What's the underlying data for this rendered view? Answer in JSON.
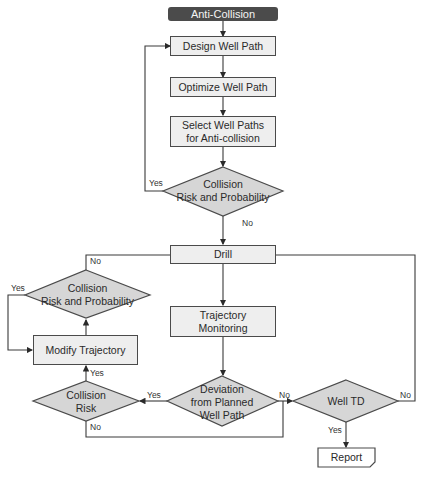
{
  "title": "Anti-Collision",
  "colors": {
    "start_fill": "#4b4b4b",
    "box_fill": "#eeeeee",
    "diamond_fill": "#d6d6d6",
    "line": "#3a3a3a"
  },
  "nodes": {
    "start": "Anti-Collision",
    "design": "Design Well Path",
    "optimize": "Optimize Well Path",
    "select_l1": "Select Well Paths",
    "select_l2": "for Anti-collision",
    "risk1_l1": "Collision",
    "risk1_l2": "Risk and Probability",
    "drill": "Drill",
    "risk2_l1": "Collision",
    "risk2_l2": "Risk and Probability",
    "modify": "Modify Trajectory",
    "monitor_l1": "Trajectory",
    "monitor_l2": "Monitoring",
    "risk3_l1": "Collision",
    "risk3_l2": "Risk",
    "deviation_l1": "Deviation",
    "deviation_l2": "from Planned",
    "deviation_l3": "Well Path",
    "welltd": "Well TD",
    "report": "Report"
  },
  "edge_labels": {
    "risk1_yes": "Yes",
    "risk1_no": "No",
    "risk2_no": "No",
    "risk2_yes": "Yes",
    "risk3_yes": "Yes",
    "risk3_no": "No",
    "deviation_yes": "Yes",
    "deviation_no": "No",
    "welltd_no": "No",
    "welltd_yes": "Yes"
  }
}
